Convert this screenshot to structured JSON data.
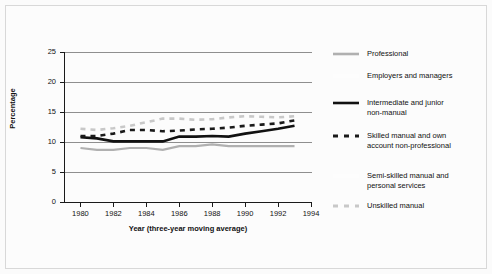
{
  "chart_data": {
    "type": "line",
    "title": "",
    "xlabel": "Year (three-year moving average)",
    "ylabel": "Percentage",
    "xlim": [
      1979,
      1994
    ],
    "ylim": [
      0,
      25
    ],
    "xticks": [
      1980,
      1982,
      1984,
      1986,
      1988,
      1990,
      1992,
      1994
    ],
    "yticks": [
      0,
      5,
      10,
      15,
      20,
      25
    ],
    "grid": "horizontal",
    "legend_position": "right",
    "x": [
      1980,
      1981,
      1982,
      1983,
      1984,
      1985,
      1986,
      1987,
      1988,
      1989,
      1990,
      1991,
      1992,
      1993
    ],
    "series": [
      {
        "name": "Professional",
        "style": "solid",
        "color": "#b0b0b0",
        "width": 2.2,
        "values": [
          9.0,
          8.7,
          8.7,
          9.0,
          9.0,
          8.7,
          9.3,
          9.3,
          9.6,
          9.3,
          9.3,
          9.3,
          9.3,
          9.3
        ]
      },
      {
        "name": "Employers and managers",
        "style": "solid",
        "color": "#fdfdfd",
        "width": 2.2,
        "values": [
          null,
          null,
          null,
          null,
          null,
          null,
          null,
          null,
          null,
          null,
          null,
          null,
          null,
          null
        ]
      },
      {
        "name": "Intermediate and junior non-manual",
        "style": "solid",
        "color": "#111111",
        "width": 2.6,
        "values": [
          10.8,
          10.6,
          10.1,
          10.1,
          10.1,
          10.1,
          10.9,
          10.9,
          11.0,
          10.9,
          11.4,
          11.8,
          12.2,
          12.7
        ]
      },
      {
        "name": "Skilled manual and own account non-professional",
        "style": "dashed",
        "color": "#1a1a1a",
        "width": 2.6,
        "values": [
          11.0,
          11.0,
          11.4,
          12.0,
          12.0,
          11.8,
          11.9,
          12.1,
          12.2,
          12.4,
          12.7,
          12.9,
          13.1,
          13.6
        ]
      },
      {
        "name": "Semi-skilled manual and personal services",
        "style": "solid",
        "color": "#fdfdfd",
        "width": 2.2,
        "values": [
          null,
          null,
          null,
          null,
          null,
          null,
          null,
          null,
          null,
          null,
          null,
          null,
          null,
          null
        ]
      },
      {
        "name": "Unskilled manual",
        "style": "dashed",
        "color": "#c8c8c8",
        "width": 2.6,
        "values": [
          12.2,
          12.0,
          12.3,
          12.7,
          13.3,
          13.9,
          13.9,
          13.7,
          13.8,
          14.1,
          14.3,
          14.2,
          14.1,
          14.3
        ]
      }
    ]
  },
  "axes": {
    "ylabel": "Percentage",
    "xlabel": "Year (three-year moving average)",
    "ytick_labels": [
      "0",
      "5",
      "10",
      "15",
      "20",
      "25"
    ],
    "xtick_labels": [
      "1980",
      "1982",
      "1984",
      "1986",
      "1988",
      "1990",
      "1992",
      "1994"
    ]
  },
  "legend": {
    "items": [
      {
        "label": "Professional",
        "swatch": "solid-gray-line-icon"
      },
      {
        "label": "Employers and managers",
        "swatch": "solid-white-line-icon"
      },
      {
        "label": "Intermediate and junior\nnon-manual",
        "swatch": "solid-black-line-icon"
      },
      {
        "label": "Skilled manual and own\naccount non-professional",
        "swatch": "dashed-black-line-icon"
      },
      {
        "label": "Semi-skilled manual and\npersonal services",
        "swatch": "solid-white-line-icon"
      },
      {
        "label": "Unskilled manual",
        "swatch": "dashed-gray-line-icon"
      }
    ]
  },
  "colors": {
    "professional": "#b0b0b0",
    "intermediate": "#111111",
    "skilled": "#1a1a1a",
    "unskilled": "#c8c8c8",
    "faint": "#fdfdfd",
    "grid": "#8f8f8f",
    "axis": "#1a1a1a",
    "background": "#fcfcfc"
  }
}
